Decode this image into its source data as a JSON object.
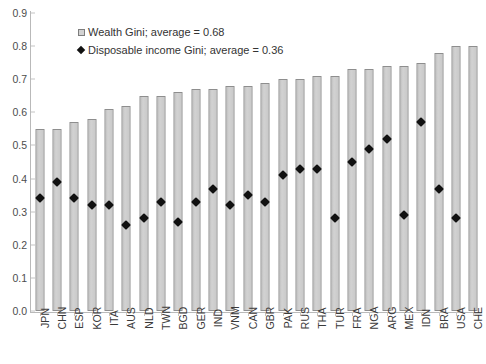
{
  "chart_data": {
    "type": "bar",
    "title": "",
    "xlabel": "",
    "ylabel": "",
    "ylim": [
      0,
      0.9
    ],
    "ytick_values": [
      0.0,
      0.1,
      0.2,
      0.3,
      0.4,
      0.5,
      0.6,
      0.7,
      0.8,
      0.9
    ],
    "ytick_labels": [
      "0.0",
      "0.1",
      "0.2",
      "0.3",
      "0.4",
      "0.5",
      "0.6",
      "0.7",
      "0.8",
      "0.9"
    ],
    "grid": false,
    "legend_position": "upper-left-inside",
    "categories": [
      "JPN",
      "CHN",
      "ESP",
      "KOR",
      "ITA",
      "AUS",
      "NLD",
      "TWN",
      "BGD",
      "GER",
      "IND",
      "VNM",
      "CAN",
      "GBR",
      "PAK",
      "RUS",
      "THA",
      "TUR",
      "FRA",
      "NGA",
      "ARG",
      "MEX",
      "IDN",
      "BRA",
      "USA",
      "CHE"
    ],
    "series": [
      {
        "name": "Wealth Gini; average = 0.68",
        "mark": "bar",
        "color": "#CCCCCC",
        "average": 0.68,
        "values": [
          0.55,
          0.55,
          0.57,
          0.58,
          0.61,
          0.62,
          0.65,
          0.65,
          0.66,
          0.67,
          0.67,
          0.68,
          0.68,
          0.69,
          0.7,
          0.7,
          0.71,
          0.71,
          0.73,
          0.73,
          0.74,
          0.74,
          0.75,
          0.78,
          0.8,
          0.8
        ]
      },
      {
        "name": "Disposable income Gini; average = 0.36",
        "mark": "diamond",
        "color": "#111111",
        "average": 0.36,
        "values": [
          0.34,
          0.39,
          0.34,
          0.32,
          0.32,
          0.26,
          0.28,
          0.33,
          0.27,
          0.33,
          0.37,
          0.32,
          0.35,
          0.33,
          0.41,
          0.43,
          0.43,
          0.28,
          0.45,
          0.49,
          0.52,
          0.29,
          0.57,
          0.37,
          0.28,
          null
        ]
      }
    ]
  },
  "legend": {
    "items": [
      {
        "key": "square-marker",
        "label": "Wealth Gini; average = 0.68"
      },
      {
        "key": "diamond-marker",
        "label": "Disposable income Gini; average = 0.36"
      }
    ]
  }
}
